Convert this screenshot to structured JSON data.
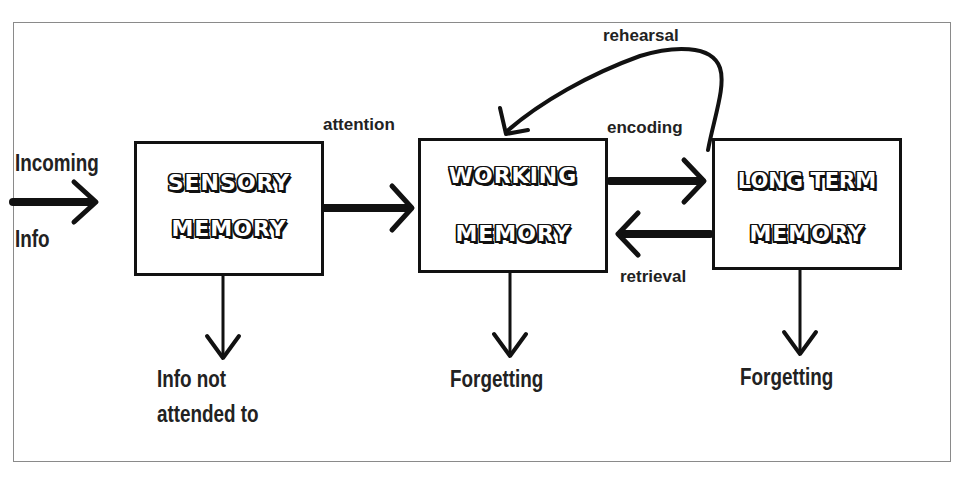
{
  "diagram": {
    "type": "flowchart",
    "colors": {
      "stroke": "#111111",
      "frame": "#8a8a8a",
      "background": "#ffffff"
    },
    "input": {
      "line1": "Incoming",
      "line2": "Info"
    },
    "boxes": {
      "sensory": {
        "line1": "SENSORY",
        "line2": "MEMORY"
      },
      "working": {
        "line1": "WORKING",
        "line2": "MEMORY"
      },
      "long_term": {
        "line1": "LONG TERM",
        "line2": "MEMORY"
      }
    },
    "edges": {
      "attention": "attention",
      "encoding": "encoding",
      "retrieval": "retrieval",
      "rehearsal": "rehearsal"
    },
    "outputs": {
      "sensory": {
        "line1": "Info not",
        "line2": "attended to"
      },
      "working": "Forgetting",
      "long_term": "Forgetting"
    }
  }
}
